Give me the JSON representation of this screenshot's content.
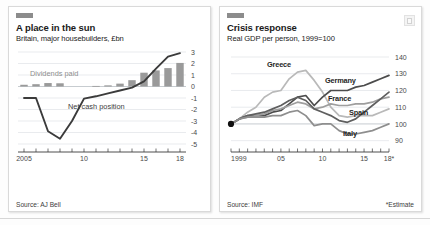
{
  "charts": [
    {
      "tab_label": "",
      "title": "A place in the sun",
      "subtitle": "Britain, major housebuilders, £bn",
      "source": "Source: AJ Bell",
      "note": "",
      "annotations": {
        "dividends": "Dividends paid",
        "netcash": "Net cash position"
      },
      "chart_data": {
        "type": "bar",
        "title": "A place in the sun",
        "subtitle": "Britain, major housebuilders, £bn",
        "xlabel": "",
        "ylabel": "£bn",
        "ylim": [
          -5,
          3
        ],
        "yticks": [
          3,
          2,
          1,
          0,
          -1,
          -2,
          -3,
          -4,
          -5
        ],
        "ytick_labels": [
          "3",
          "2",
          "1",
          "0",
          "-1",
          "-2",
          "-3",
          "-4",
          "-5"
        ],
        "xticks": [
          2005,
          2010,
          2015,
          2018
        ],
        "xtick_labels": [
          "2005",
          "10",
          "15",
          "18"
        ],
        "xlim": [
          2005,
          2018
        ],
        "grid": true,
        "categories": [
          2005,
          2006,
          2007,
          2008,
          2009,
          2010,
          2011,
          2012,
          2013,
          2014,
          2015,
          2016,
          2017,
          2018
        ],
        "series": [
          {
            "name": "Dividends paid",
            "type": "bar",
            "color": "#9a9a9a",
            "values": [
              0.15,
              0.2,
              0.3,
              0.28,
              0.0,
              0.0,
              0.05,
              0.1,
              0.25,
              0.55,
              1.2,
              1.4,
              1.6,
              2.05
            ]
          },
          {
            "name": "Net cash position",
            "type": "line",
            "color": "#3b3b3b",
            "values": [
              -1.0,
              -1.0,
              -3.9,
              -4.55,
              -3.0,
              -1.05,
              -0.85,
              -0.6,
              -0.35,
              -0.1,
              0.45,
              1.55,
              2.6,
              2.9
            ]
          }
        ]
      }
    },
    {
      "tab_label": "",
      "title": "Crisis response",
      "subtitle": "Real GDP per person, 1999=100",
      "source": "Source: IMF",
      "note": "*Estimate",
      "annotations": {},
      "chart_data": {
        "type": "line",
        "title": "Crisis response",
        "subtitle": "Real GDP per person, 1999=100",
        "xlabel": "",
        "ylabel": "Index, 1999=100",
        "ylim": [
          88,
          143
        ],
        "yticks": [
          140,
          130,
          120,
          110,
          100,
          90
        ],
        "ytick_labels": [
          "140",
          "130",
          "120",
          "110",
          "100",
          "90"
        ],
        "xticks": [
          1999,
          2005,
          2010,
          2015,
          2018
        ],
        "xtick_labels": [
          "1999",
          "05",
          "10",
          "15",
          "18*"
        ],
        "xlim": [
          1999,
          2018
        ],
        "grid": true,
        "x": [
          1999,
          2000,
          2001,
          2002,
          2003,
          2004,
          2005,
          2006,
          2007,
          2008,
          2009,
          2010,
          2011,
          2012,
          2013,
          2014,
          2015,
          2016,
          2017,
          2018
        ],
        "series": [
          {
            "name": "Greece",
            "color": "#b9b9b9",
            "values": [
              100,
              103,
              107,
              110,
              116,
              119,
              120,
              127,
              131,
              132,
              126,
              119,
              110,
              105,
              104,
              105,
              105,
              105,
              107,
              109
            ]
          },
          {
            "name": "Germany",
            "color": "#4c4c4c",
            "values": [
              100,
              103,
              105,
              105,
              105,
              107,
              108,
              112,
              116,
              117,
              111,
              116,
              120,
              120,
              120,
              122,
              123,
              125,
              127,
              129
            ]
          },
          {
            "name": "France",
            "color": "#9e9e9e",
            "values": [
              100,
              103,
              104,
              105,
              106,
              108,
              109,
              111,
              113,
              112,
              109,
              110,
              112,
              111,
              111,
              112,
              112,
              113,
              115,
              116
            ]
          },
          {
            "name": "Spain",
            "color": "#5f5f5f",
            "values": [
              100,
              103,
              105,
              106,
              107,
              109,
              111,
              114,
              116,
              114,
              109,
              107,
              105,
              102,
              101,
              103,
              107,
              111,
              115,
              119
            ]
          },
          {
            "name": "Italy",
            "color": "#8e8e8e",
            "values": [
              100,
              103,
              104,
              104,
              104,
              105,
              105,
              107,
              108,
              105,
              99,
              100,
              100,
              96,
              94,
              94,
              95,
              96,
              98,
              100
            ]
          }
        ],
        "start_marker": {
          "x": 1999,
          "y": 100,
          "color": "#111111"
        }
      }
    }
  ]
}
